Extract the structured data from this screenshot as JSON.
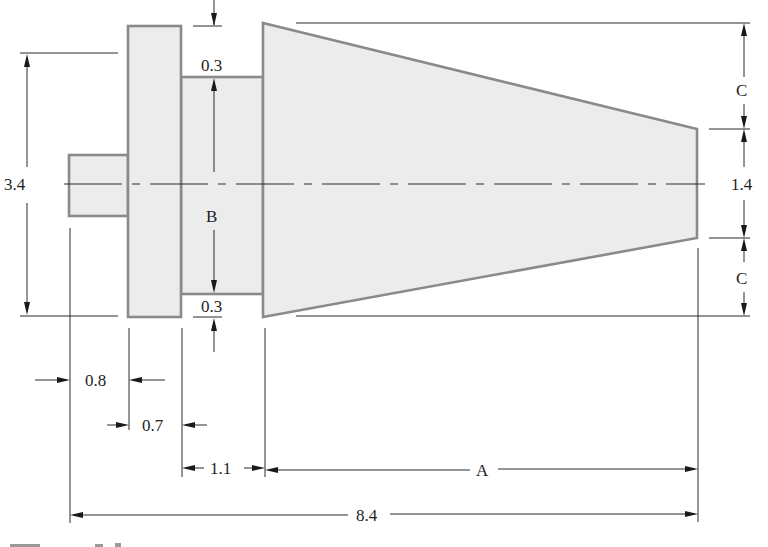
{
  "figure": {
    "type": "engineering-drawing",
    "caption_partial": "Figure 3.x (clipped at bottom edge)"
  },
  "labels": {
    "overall_height": "3.4",
    "top_step": "0.3",
    "bottom_step": "0.3",
    "middle_diameter": "B",
    "cone_top_offset": "C",
    "cone_bottom_offset": "C",
    "cone_end_diameter": "1.4",
    "small_shaft_length": "0.8",
    "flange_length": "0.7",
    "middle_length": "1.1",
    "cone_length": "A",
    "overall_length": "8.4"
  },
  "colors": {
    "part_fill": "#ececec",
    "part_outline": "#8a8a8a",
    "line": "#2a2a2a",
    "text": "#1e1e1e"
  }
}
